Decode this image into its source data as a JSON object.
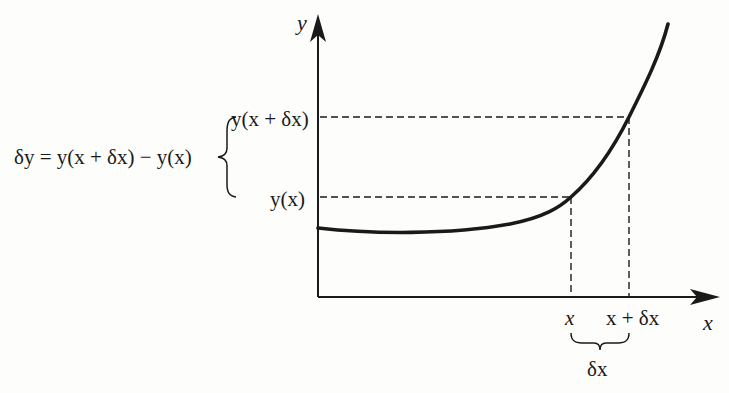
{
  "diagram": {
    "axes": {
      "y_label": "y",
      "x_label": "x"
    },
    "x_ticks": {
      "x": "x",
      "x_plus_dx": "x + δx"
    },
    "y_ticks": {
      "y_x_plus_dx": "y(x + δx)",
      "y_x": "y(x)"
    },
    "equation": "δy = y(x + δx) − y(x)",
    "dx_label": "δx",
    "colors": {
      "ink": "#1a1a1a",
      "background": "#fdfdfb"
    }
  }
}
